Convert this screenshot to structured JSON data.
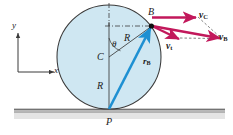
{
  "figure": {
    "colors": {
      "circle_fill": "#cfe7f2",
      "circle_stroke": "#3a3a3a",
      "velocity_vector": "#c2185b",
      "position_vector": "#1e90d2",
      "ground_fill": "#c9c9c9",
      "construction_line": "#4a4a4a",
      "text": "#1a1a1a",
      "background": "#ffffff"
    },
    "labels": {
      "axis_y": "y",
      "axis_x": "x",
      "center": "C",
      "contact_point": "P",
      "rim_point": "B",
      "radius_upper": "R",
      "radius_lower": "R",
      "angle": "θ",
      "position_vector": "r",
      "position_vector_sub": "B",
      "velocity_center": "v",
      "velocity_center_sub": "C",
      "velocity_tangential": "v",
      "velocity_tangential_sub": "t",
      "velocity_point": "v",
      "velocity_point_sub": "B"
    },
    "geometry": {
      "circle_center_x": 109,
      "circle_center_y": 57,
      "circle_radius": 52,
      "point_B_x": 152,
      "point_B_y": 26,
      "point_P_x": 109,
      "point_P_y": 109,
      "ground_y": 110
    }
  }
}
